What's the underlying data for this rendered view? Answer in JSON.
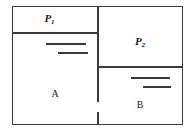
{
  "figure": {
    "line_color": "#3a3a3a",
    "text_color": "#1a1a1a",
    "background": "#ffffff"
  },
  "regions": [
    {
      "id": "p1",
      "label": "P",
      "subscript": "1",
      "name": "upper-left-chamber"
    },
    {
      "id": "p2",
      "label": "P",
      "subscript": "2",
      "name": "upper-right-chamber"
    },
    {
      "id": "a",
      "label": "A",
      "subscript": "",
      "name": "lower-left-chamber"
    },
    {
      "id": "b",
      "label": "B",
      "subscript": "",
      "name": "lower-right-chamber"
    }
  ],
  "level_marks": {
    "region_a": [
      "upper-level-line",
      "lower-level-line"
    ],
    "region_b": [
      "upper-level-line",
      "lower-level-line"
    ]
  },
  "partitions": {
    "horizontal_left": "divider-below-p1",
    "horizontal_right": "divider-below-p2",
    "vertical_center": "central-partition"
  }
}
